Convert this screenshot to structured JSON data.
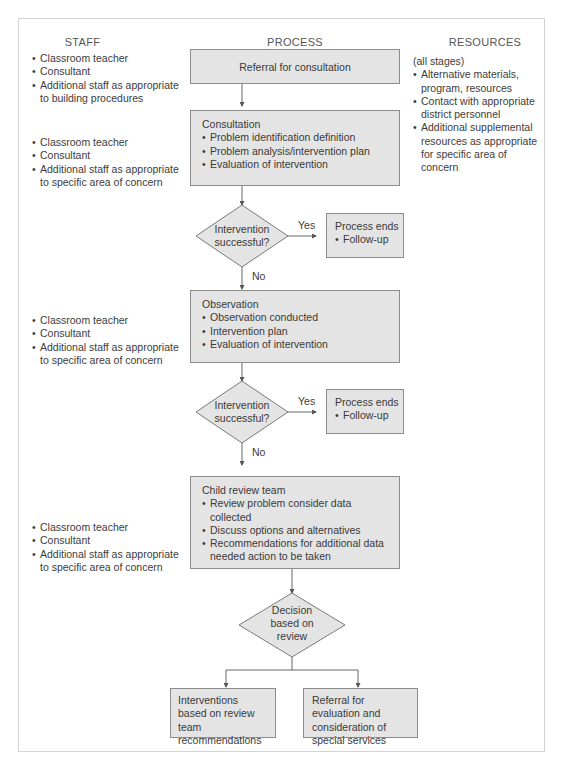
{
  "columns": {
    "staff": "STAFF",
    "process": "PROCESS",
    "resources": "RESOURCES"
  },
  "staff_groups": [
    {
      "items": [
        "Classroom teacher",
        "Consultant",
        "Additional staff as appropriate to building procedures"
      ]
    },
    {
      "items": [
        "Classroom teacher",
        "Consultant",
        "Additional staff as appropriate to specific area of concern"
      ]
    },
    {
      "items": [
        "Classroom teacher",
        "Consultant",
        "Additional staff as appropriate to specific area of concern"
      ]
    },
    {
      "items": [
        "Classroom teacher",
        "Consultant",
        "Additional staff as appropriate to specific area of concern"
      ]
    }
  ],
  "resources": {
    "intro": "(all stages)",
    "items": [
      "Alternative materials, program, resources",
      "Contact with appropriate district personnel",
      "Additional supplemental resources as appropriate for specific area of concern"
    ]
  },
  "process": {
    "referral": "Referral for consultation",
    "consultation": {
      "title": "Consultation",
      "items": [
        "Problem identification definition",
        "Problem analysis/intervention plan",
        "Evaluation of intervention"
      ]
    },
    "decision1": {
      "line1": "Intervention",
      "line2": "successful?",
      "yes": "Yes",
      "no": "No"
    },
    "end1": {
      "title": "Process ends",
      "item": "Follow-up"
    },
    "observation": {
      "title": "Observation",
      "items": [
        "Observation conducted",
        "Intervention plan",
        "Evaluation of intervention"
      ]
    },
    "decision2": {
      "line1": "Intervention",
      "line2": "successful?",
      "yes": "Yes",
      "no": "No"
    },
    "end2": {
      "title": "Process ends",
      "item": "Follow-up"
    },
    "review_team": {
      "title": "Child review team",
      "items": [
        "Review problem consider data collected",
        "Discuss options and alternatives",
        "Recommendations for additional data needed action to be taken"
      ]
    },
    "decision3": {
      "line1": "Decision",
      "line2": "based on",
      "line3": "review"
    },
    "outcome_left": "Interventions based on review team recommendations",
    "outcome_right": "Referral for evaluation and consideration of special services"
  }
}
